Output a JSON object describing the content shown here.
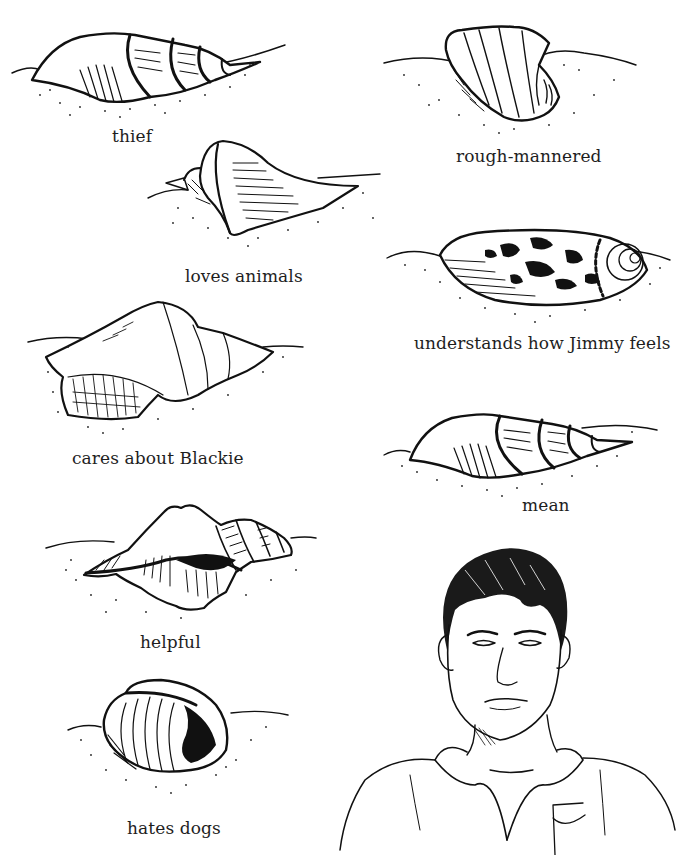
{
  "illustration": {
    "style": "black ink pen drawing on white",
    "colors": {
      "ink": "#111111",
      "background": "#ffffff"
    }
  },
  "shells": [
    {
      "id": "thief",
      "label": "thief",
      "type": "auger-spiral"
    },
    {
      "id": "rough-mannered",
      "label": "rough-mannered",
      "type": "ribbed-conch"
    },
    {
      "id": "loves-animals",
      "label": "loves animals",
      "type": "flared-conch"
    },
    {
      "id": "understands",
      "label": "understands how Jimmy feels",
      "type": "spotted-cone"
    },
    {
      "id": "cares-about-blackie",
      "label": "cares about Blackie",
      "type": "whelk"
    },
    {
      "id": "mean",
      "label": "mean",
      "type": "auger-spiral"
    },
    {
      "id": "helpful",
      "label": "helpful",
      "type": "spiky-conch"
    },
    {
      "id": "hates-dogs",
      "label": "hates dogs",
      "type": "bubble-shell"
    }
  ],
  "portrait": {
    "subject": "young man with short dark hair in collared shirt with pocket"
  }
}
